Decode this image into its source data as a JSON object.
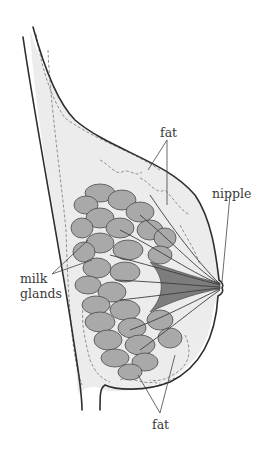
{
  "diagram": {
    "labels": {
      "fat_top": "fat",
      "nipple": "nipple",
      "milk_glands_line1": "milk",
      "milk_glands_line2": "glands",
      "fat_bottom": "fat"
    },
    "colors": {
      "outline": "#2e2e2e",
      "fat_tissue": "#ececec",
      "gland_lobes": "#a9a9a9",
      "ducts": "#7d7d7d",
      "label_text": "#3a3a3a"
    }
  }
}
